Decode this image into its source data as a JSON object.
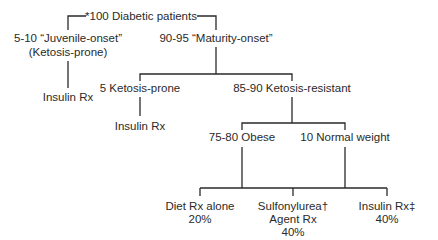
{
  "diagram": {
    "type": "tree",
    "root": {
      "label": "*100 Diabetic patients"
    },
    "juvenile": {
      "line1": "5-10 “Juvenile-onset”",
      "line2": "(Ketosis-prone)",
      "treatment": "Insulin Rx"
    },
    "maturity": {
      "label": "90-95 “Maturity-onset”"
    },
    "ketosis_prone": {
      "label": "5 Ketosis-prone",
      "treatment": "Insulin Rx"
    },
    "ketosis_resistant": {
      "label": "85-90 Ketosis-resistant"
    },
    "obese": {
      "label": "75-80 Obese"
    },
    "normal_weight": {
      "label": "10 Normal weight"
    },
    "outcomes": [
      {
        "line1": "Diet Rx alone",
        "line2": "20%"
      },
      {
        "line1": "Sulfonylurea†",
        "line2": "Agent Rx",
        "line3": "40%"
      },
      {
        "line1": "Insulin Rx‡",
        "line2": "40%"
      }
    ],
    "colors": {
      "ink": "#2a2a2a",
      "background": "#ffffff"
    }
  }
}
